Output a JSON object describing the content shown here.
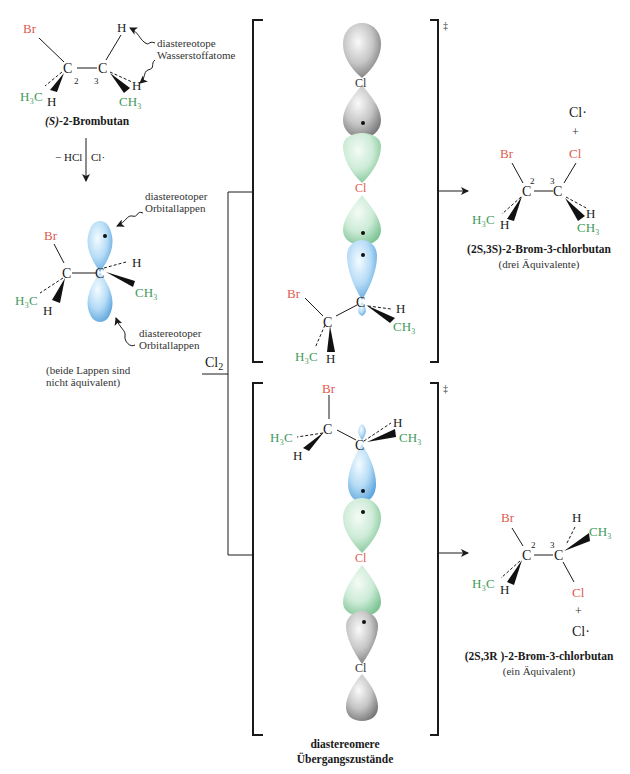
{
  "colors": {
    "halogen_red": "#e05a4f",
    "methyl_green": "#3f9a5a",
    "orbital_blue": "#9ccbf0",
    "orbital_green": "#bfe6cc",
    "orbital_gray": "#b8b8b8",
    "ink": "#1a1a1a"
  },
  "reactant": {
    "atoms": {
      "br": "Br",
      "c2": "C",
      "c3": "C",
      "h_top": "H",
      "h_c2": "H",
      "h3c": "H₃C",
      "ch3": "CH₃",
      "h_c3": "H"
    },
    "locants": {
      "c2": "2",
      "c3": "3"
    },
    "annotation": [
      "diastereotope",
      "Wasserstoffatome"
    ],
    "name_config": "(S)",
    "name_rest": "-2-Brombutan"
  },
  "step1": {
    "left_label": "− HCl",
    "right_label": "Cl·"
  },
  "radical": {
    "atoms": {
      "br": "Br",
      "c2": "C",
      "c3": "C",
      "h3c": "H₃C",
      "h_c2": "H",
      "h_c3": "H",
      "ch3": "CH₃"
    },
    "annotation_top": [
      "diastereotoper",
      "Orbitallappen"
    ],
    "annotation_bottom": [
      "diastereotoper",
      "Orbitallappen"
    ],
    "note": [
      "(beide Lappen sind",
      "nicht äquivalent)"
    ]
  },
  "reagent": {
    "label": "Cl",
    "subscript": "2"
  },
  "transition_state_top": {
    "cl_upper": "Cl",
    "cl_lower": "Cl",
    "atoms": {
      "br": "Br",
      "c2": "C",
      "c3": "C",
      "h_c3": "H",
      "ch3": "CH₃",
      "h3c": "H₃C",
      "h_c2": "H"
    },
    "dagger": "‡"
  },
  "transition_state_bottom": {
    "atoms": {
      "br": "Br",
      "c2": "C",
      "c3": "C",
      "h3c": "H₃C",
      "h_c2": "H",
      "h_c3": "H",
      "ch3": "CH₃"
    },
    "cl_upper": "Cl",
    "cl_lower": "Cl",
    "dagger": "‡"
  },
  "ts_caption": [
    "diastereomere",
    "Übergangszustände"
  ],
  "product_top": {
    "byproduct": "Cl·",
    "plus": "+",
    "atoms": {
      "br": "Br",
      "cl": "Cl",
      "c2": "C",
      "c3": "C",
      "h3c": "H₃C",
      "h_c2": "H",
      "h_c3": "H",
      "ch3": "CH₃"
    },
    "locants": {
      "c2": "2",
      "c3": "3"
    },
    "name_config": "(2S,3S)",
    "name_rest": "-2-Brom-3-chlorbutan",
    "note": "(drei Äquivalente)"
  },
  "product_bottom": {
    "atoms": {
      "br": "Br",
      "cl": "Cl",
      "c2": "C",
      "c3": "C",
      "h3c": "H₃C",
      "h_c2": "H",
      "h_c3": "H",
      "ch3": "CH₃"
    },
    "locants": {
      "c2": "2",
      "c3": "3"
    },
    "plus": "+",
    "byproduct": "Cl·",
    "name_config": "(2S,3R )",
    "name_rest": "-2-Brom-3-chlorbutan",
    "note": "(ein Äquivalent)"
  }
}
